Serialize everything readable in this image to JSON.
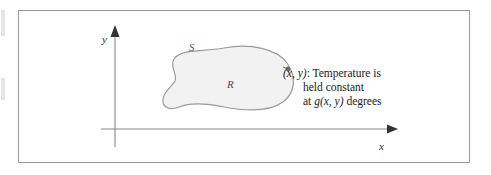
{
  "figure": {
    "type": "math-diagram",
    "axes": {
      "y_label": "y",
      "x_label": "x"
    },
    "region": {
      "boundary_label": "S",
      "interior_label": "R",
      "fill_color": "#f2f2f2",
      "stroke_color": "#9a9a9a"
    },
    "annotation": {
      "point_marker": "boundary-point-dot",
      "lines": [
        {
          "text": "(x, y): Temperature is",
          "indented": false
        },
        {
          "text": "held constant",
          "indented": true
        },
        {
          "text": "at g(x, y) degrees",
          "indented": true
        }
      ],
      "line1_point": "(x, y)",
      "line1_rest": ": Temperature is",
      "line2": "held constant",
      "line3_prefix": "at ",
      "line3_func": "g(x, y)",
      "line3_suffix": " degrees"
    },
    "colors": {
      "frame_border": "#9a9a9a",
      "axis": "#8a8a8a",
      "text": "#1a1a1a"
    }
  }
}
